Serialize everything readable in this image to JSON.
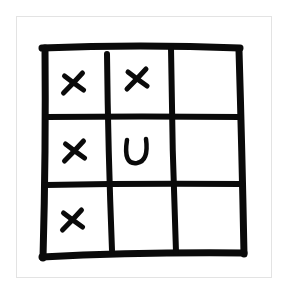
{
  "game": {
    "type": "tic-tac-toe",
    "rows": 3,
    "cols": 3,
    "board": [
      [
        "X",
        "X",
        ""
      ],
      [
        "X",
        "U",
        ""
      ],
      [
        "X",
        "",
        ""
      ]
    ],
    "colors": {
      "ink": "#0a0a0a",
      "background": "#ffffff",
      "frame": "#e3e3e3"
    }
  }
}
